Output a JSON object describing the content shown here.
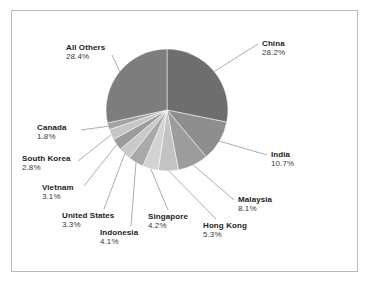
{
  "frame": {
    "border_color": "#b9b9b9",
    "background": "#ffffff"
  },
  "chart_data": {
    "type": "pie",
    "title": "",
    "subtitle": "",
    "xlabel": "",
    "ylabel": "",
    "legend_position": "none",
    "grid": false,
    "labels_outside": true,
    "leader_lines": true,
    "start_angle_deg": 0,
    "direction": "clockwise",
    "units": "percent",
    "categories": [
      "China",
      "India",
      "Malaysia",
      "Hong Kong",
      "Singapore",
      "Indonesia",
      "United States",
      "Vietnam",
      "South Korea",
      "Canada",
      "All Others"
    ],
    "values": [
      28.2,
      10.7,
      8.1,
      5.3,
      4.2,
      4.1,
      3.3,
      3.1,
      2.8,
      1.8,
      28.4
    ],
    "value_labels": [
      "28.2%",
      "10.7%",
      "8.1%",
      "5.3%",
      "4.2%",
      "4.1%",
      "3.3%",
      "3.1%",
      "2.8%",
      "1.8%",
      "28.4%"
    ],
    "colors": [
      "#6e6e6e",
      "#8e8e8e",
      "#9d9d9d",
      "#c3c3c3",
      "#d3d3d3",
      "#a9a9a9",
      "#c9c9c9",
      "#9b9b9b",
      "#c6c6c6",
      "#a3a3a3",
      "#7d7d7d"
    ],
    "slices": [
      {
        "name": "China",
        "value": 28.2,
        "label": "China",
        "value_label": "28.2%",
        "color": "#6e6e6e"
      },
      {
        "name": "India",
        "value": 10.7,
        "label": "India",
        "value_label": "10.7%",
        "color": "#8e8e8e"
      },
      {
        "name": "Malaysia",
        "value": 8.1,
        "label": "Malaysia",
        "value_label": "8.1%",
        "color": "#9d9d9d"
      },
      {
        "name": "Hong Kong",
        "value": 5.3,
        "label": "Hong Kong",
        "value_label": "5.3%",
        "color": "#c3c3c3"
      },
      {
        "name": "Singapore",
        "value": 4.2,
        "label": "Singapore",
        "value_label": "4.2%",
        "color": "#d3d3d3"
      },
      {
        "name": "Indonesia",
        "value": 4.1,
        "label": "Indonesia",
        "value_label": "4.1%",
        "color": "#a9a9a9"
      },
      {
        "name": "United States",
        "value": 3.3,
        "label": "United States",
        "value_label": "3.3%",
        "color": "#c9c9c9"
      },
      {
        "name": "Vietnam",
        "value": 3.1,
        "label": "Vietnam",
        "value_label": "3.1%",
        "color": "#9b9b9b"
      },
      {
        "name": "South Korea",
        "value": 2.8,
        "label": "South Korea",
        "value_label": "2.8%",
        "color": "#c6c6c6"
      },
      {
        "name": "Canada",
        "value": 1.8,
        "label": "Canada",
        "value_label": "1.8%",
        "color": "#a3a3a3"
      },
      {
        "name": "All Others",
        "value": 28.4,
        "label": "All Others",
        "value_label": "28.4%",
        "color": "#7d7d7d"
      }
    ]
  }
}
